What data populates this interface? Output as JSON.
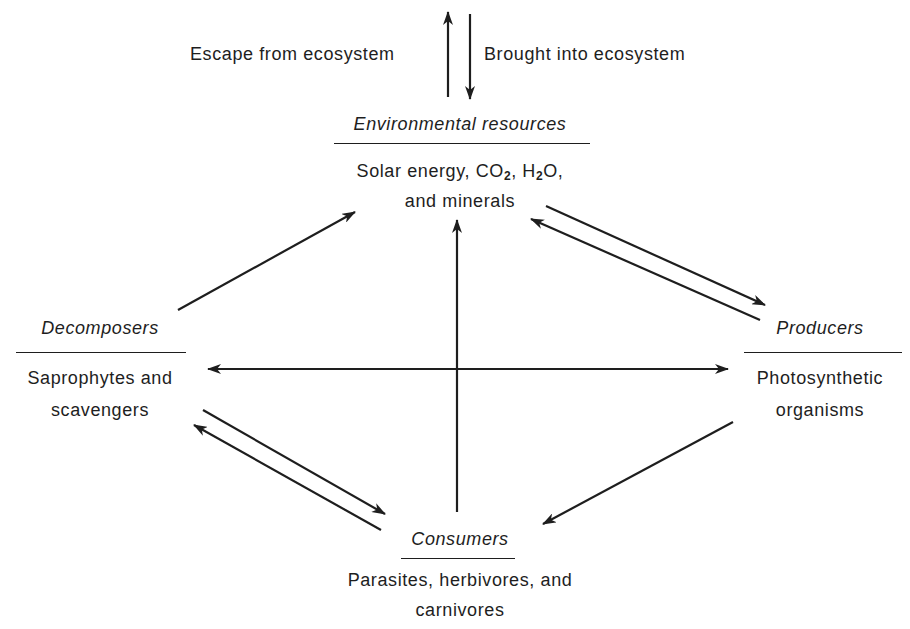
{
  "flows": {
    "escape_label": "Escape from ecosystem",
    "brought_label": "Brought into ecosystem"
  },
  "nodes": {
    "environment": {
      "title": "Environmental resources",
      "line1_a": "Solar energy, CO",
      "line1_sub1": "2",
      "line1_b": ", H",
      "line1_sub2": "2",
      "line1_c": "O,",
      "line2": "and minerals"
    },
    "decomposers": {
      "title": "Decomposers",
      "line1": "Saprophytes and",
      "line2": "scavengers"
    },
    "producers": {
      "title": "Producers",
      "line1": "Photosynthetic",
      "line2": "organisms"
    },
    "consumers": {
      "title": "Consumers",
      "line1": "Parasites, herbivores, and",
      "line2": "carnivores"
    }
  },
  "edges": [
    {
      "from": "Environmental resources",
      "to": "outside (escape)"
    },
    {
      "from": "outside",
      "to": "Environmental resources"
    },
    {
      "from": "Environmental resources",
      "to": "Producers"
    },
    {
      "from": "Producers",
      "to": "Environmental resources"
    },
    {
      "from": "Decomposers",
      "to": "Environmental resources"
    },
    {
      "from": "center",
      "to": "Environmental resources"
    },
    {
      "from": "center",
      "to": "Decomposers"
    },
    {
      "from": "center",
      "to": "Producers"
    },
    {
      "from": "Producers",
      "to": "Consumers"
    },
    {
      "from": "Decomposers",
      "to": "Consumers"
    },
    {
      "from": "Consumers",
      "to": "Decomposers"
    }
  ],
  "colors": {
    "ink": "#1e1e1e",
    "background": "#ffffff"
  }
}
